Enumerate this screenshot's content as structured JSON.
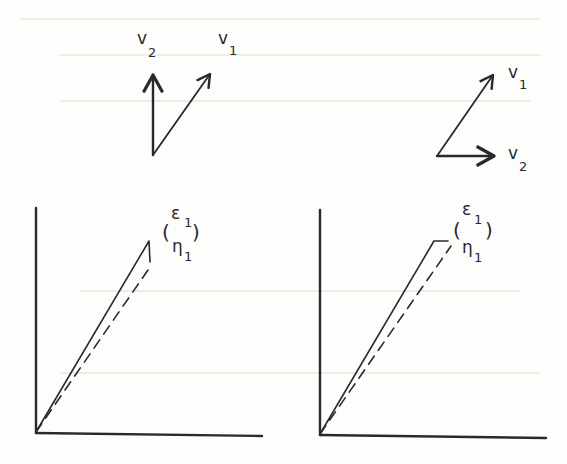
{
  "figure": {
    "type": "linear-algebra eigenvector diagram",
    "ink_color": "#2a2a2a",
    "background_color": "#fdfdfb",
    "panels": [
      {
        "id": "left",
        "basis_vectors": {
          "v2": {
            "label": "v",
            "subscript": "2",
            "direction": "vertical-up"
          },
          "v1": {
            "label": "v",
            "subscript": "1",
            "direction": "diagonal-up-right"
          }
        },
        "plot": {
          "solid_line": "trajectory rising from origin, ends with short vertical drop",
          "dashed_line": "trajectory rising from origin below the solid line",
          "annotation": {
            "open": "(",
            "top": "ε",
            "top_sub": "1",
            "close": ")",
            "bottom": "η",
            "bottom_sub": "1"
          }
        }
      },
      {
        "id": "right",
        "basis_vectors": {
          "v1": {
            "label": "v",
            "subscript": "1",
            "direction": "diagonal-up-right"
          },
          "v2": {
            "label": "v",
            "subscript": "2",
            "direction": "horizontal-right"
          }
        },
        "plot": {
          "solid_line": "trajectory rising from origin, ends with short horizontal step",
          "dashed_line": "trajectory rising from origin below the solid line",
          "annotation": {
            "open": "(",
            "top": "ε",
            "top_sub": "1",
            "close": ")",
            "bottom": "η",
            "bottom_sub": "1"
          }
        }
      }
    ]
  }
}
